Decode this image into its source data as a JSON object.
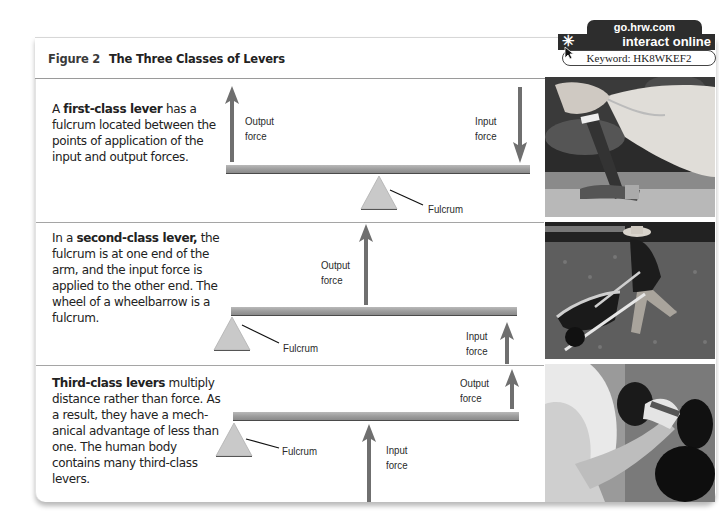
{
  "figure": {
    "number": "Figure 2",
    "title": "The Three Classes of Levers"
  },
  "online_badge": {
    "site": "go.hrw.com",
    "tagline": "interact online",
    "keyword_label": "Keyword:",
    "keyword": "HK8WKEF2",
    "keyword_full": "Keyword: HK8WKEF2"
  },
  "levers": [
    {
      "class": "first-class",
      "text_pre": "A ",
      "text_bold": "first-class lever",
      "text_post": " has a fulcrum located between the points of application of the input and output forces.",
      "labels": {
        "output_1": "Output",
        "output_2": "force",
        "input_1": "Input",
        "input_2": "force",
        "fulcrum": "Fulcrum"
      },
      "photo": "hammer-pulling-nail"
    },
    {
      "class": "second-class",
      "text_pre": "In a ",
      "text_bold": "second-class lever,",
      "text_post": " the fulcrum is at one end of the arm, and the input force is applied to the other end. The wheel of a wheelbarrow is a fulcrum.",
      "labels": {
        "output_1": "Output",
        "output_2": "force",
        "input_1": "Input",
        "input_2": "force",
        "fulcrum": "Fulcrum"
      },
      "photo": "man-pushing-wheelbarrow"
    },
    {
      "class": "third-class",
      "text_pre": "",
      "text_bold": "Third-class levers",
      "text_post": " multiply distance rather than force. As a result, they have a mech-anical advantage of less than one. The human body contains many third-class levers.",
      "labels": {
        "output_1": "Output",
        "output_2": "force",
        "input_1": "Input",
        "input_2": "force",
        "fulcrum": "Fulcrum"
      },
      "photo": "arm-lifting-dumbbell"
    }
  ],
  "colors": {
    "arrow": "#6f6f6f",
    "fulcrum_fill": "#c9c9c9",
    "beam": "#a3a3a3",
    "badge_bg": "#2d2d2d"
  }
}
